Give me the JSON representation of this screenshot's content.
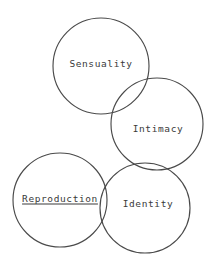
{
  "diagram": {
    "type": "venn",
    "title": "",
    "background_color": "#ffffff",
    "stroke_color": "#4a4a4a",
    "text_color": "#3a3a3a",
    "circles": [
      {
        "id": "sensuality",
        "label": "Sensuality",
        "cx": 101,
        "cy": 66,
        "r": 48,
        "label_x": 101,
        "label_y": 63,
        "underlined": false
      },
      {
        "id": "intimacy",
        "label": "Intimacy",
        "cx": 157,
        "cy": 124,
        "r": 46,
        "label_x": 158,
        "label_y": 128,
        "underlined": false
      },
      {
        "id": "reproduction",
        "label": "Reproduction",
        "cx": 60,
        "cy": 200,
        "r": 47,
        "label_x": 60,
        "label_y": 198,
        "underlined": true
      },
      {
        "id": "identity",
        "label": "Identity",
        "cx": 145,
        "cy": 208,
        "r": 45,
        "label_x": 148,
        "label_y": 203,
        "underlined": false
      }
    ]
  }
}
